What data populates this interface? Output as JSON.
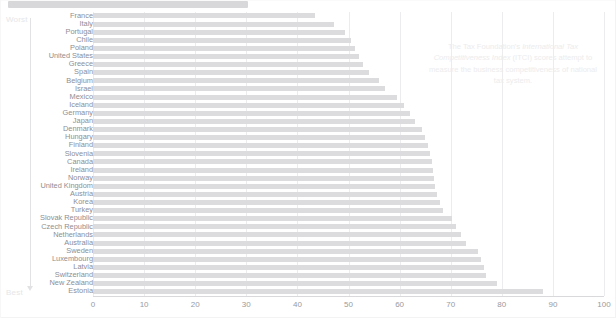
{
  "header": {
    "title_placeholder": ""
  },
  "axis_annotations": {
    "worst_label": "Worst",
    "best_label": "Best"
  },
  "annotation": {
    "line1": "The Tax Foundation's ",
    "emphasis1": "International Tax",
    "emphasis2": "Competitiveness Index",
    "line2": " (ITCI) scores",
    "line3": "attempt to measure the business",
    "line4": "competitiveness of national tax system."
  },
  "colors": {
    "bar": "#dcdcde",
    "gridline": "#ececee",
    "label": "#8e8e93",
    "tick": "#9a9a9e",
    "annotation": "#ececed",
    "arrow": "#e2e2e4"
  },
  "chart_data": {
    "type": "bar",
    "orientation": "horizontal",
    "title": "",
    "xlabel": "",
    "ylabel": "",
    "xlim": [
      0,
      100
    ],
    "ticks": [
      0,
      10,
      20,
      30,
      40,
      50,
      60,
      70,
      80,
      90,
      100
    ],
    "grid": true,
    "legend": "none",
    "categories": [
      "France",
      "Italy",
      "Portugal",
      "Chile",
      "Poland",
      "United States",
      "Greece",
      "Spain",
      "Belgium",
      "Israel",
      "Mexico",
      "Iceland",
      "Germany",
      "Japan",
      "Denmark",
      "Hungary",
      "Finland",
      "Slovenia",
      "Canada",
      "Ireland",
      "Norway",
      "United Kingdom",
      "Austria",
      "Korea",
      "Turkey",
      "Slovak Republic",
      "Czech Republic",
      "Netherlands",
      "Australia",
      "Sweden",
      "Luxembourg",
      "Latvia",
      "Switzerland",
      "New Zealand",
      "Estonia"
    ],
    "values": [
      43.4,
      47.1,
      49.4,
      50.5,
      51.2,
      52.1,
      52.8,
      54.0,
      56.0,
      57.2,
      59.4,
      60.8,
      62.0,
      63.0,
      64.3,
      65.0,
      65.6,
      66.0,
      66.3,
      66.5,
      66.8,
      67.0,
      67.4,
      68.0,
      68.4,
      70.2,
      71.0,
      72.0,
      73.0,
      75.4,
      76.0,
      76.5,
      77.0,
      79.0,
      88.0
    ]
  }
}
